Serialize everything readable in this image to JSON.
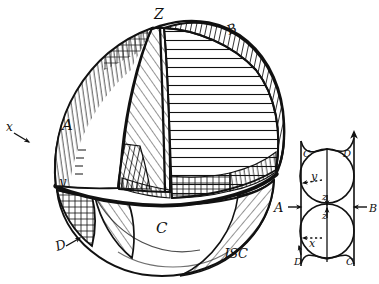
{
  "figure": {
    "signature": "JSC",
    "background_color": "#ffffff",
    "ink_color": "#111111"
  },
  "sphere_labels": {
    "top_axis": "Z",
    "region_a": "A",
    "region_b": "B",
    "region_c": "C",
    "region_d": "D",
    "axis_x": "x",
    "axis_y": "y"
  },
  "key_diagram": {
    "corner_top_left": "C",
    "corner_top_right": "D",
    "corner_bottom_left": "D",
    "corner_bottom_right": "C",
    "left_arrow_label": "A",
    "right_arrow_label": "B",
    "center_upper_label": "z",
    "center_lower_label": "z",
    "upper_dashed_label": "y",
    "lower_dashed_label": "x"
  }
}
